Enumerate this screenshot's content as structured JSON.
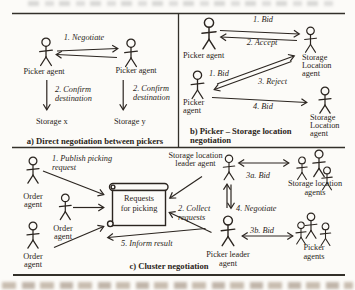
{
  "colors": {
    "ink": "#2b2520",
    "paper": "#fcfbf8"
  },
  "panel_a": {
    "caption": "a) Direct negotiation between pickers",
    "picker_left": "Picker agent",
    "picker_right": "Picker agent",
    "negotiate": "1. Negotiate",
    "confirm_left": {
      "l1": "2. Confirm",
      "l2": "destination"
    },
    "confirm_right": {
      "l1": "2. Confirm",
      "l2": "destination"
    },
    "storage_x": "Storage x",
    "storage_y": "Storage y"
  },
  "panel_b": {
    "caption_l1": "b) Picker – Storage location",
    "caption_l2": "negotiation",
    "picker_top": "Picker agent",
    "picker_bottom": {
      "l1": "Picker",
      "l2": "agent"
    },
    "storage_top": {
      "l1": "Storage",
      "l2": "Location",
      "l3": "agent"
    },
    "storage_bottom": {
      "l1": "Storage",
      "l2": "Location",
      "l3": "agent"
    },
    "bid_top": "1. Bid",
    "accept": "2. Accept",
    "bid_bottom": "1. Bid",
    "reject": "3. Reject",
    "bid_4": "4. Bid"
  },
  "panel_c": {
    "caption": "c) Cluster negotiation",
    "order_1": {
      "l1": "Order",
      "l2": "agent"
    },
    "order_2": {
      "l1": "Order",
      "l2": "agent"
    },
    "order_3": {
      "l1": "Order",
      "l2": "agent"
    },
    "publish": {
      "l1": "1. Publish picking",
      "l2": "request"
    },
    "board": {
      "l1": "Requests",
      "l2": "for picking"
    },
    "collect": {
      "l1": "2. Collect",
      "l2": "requests"
    },
    "inform": "5. Inform result",
    "negotiate": "4. Negotiate",
    "bid_3a": "3a. Bid",
    "bid_3b": "3b. Bid",
    "storage_leader": {
      "l1": "Storage location",
      "l2": "leader agent"
    },
    "storage_agents": {
      "l1": "Storage location",
      "l2": "agents"
    },
    "picker_leader": {
      "l1": "Picker leader",
      "l2": "agent"
    },
    "picker_agents": {
      "l1": "Picker",
      "l2": "agents"
    }
  }
}
